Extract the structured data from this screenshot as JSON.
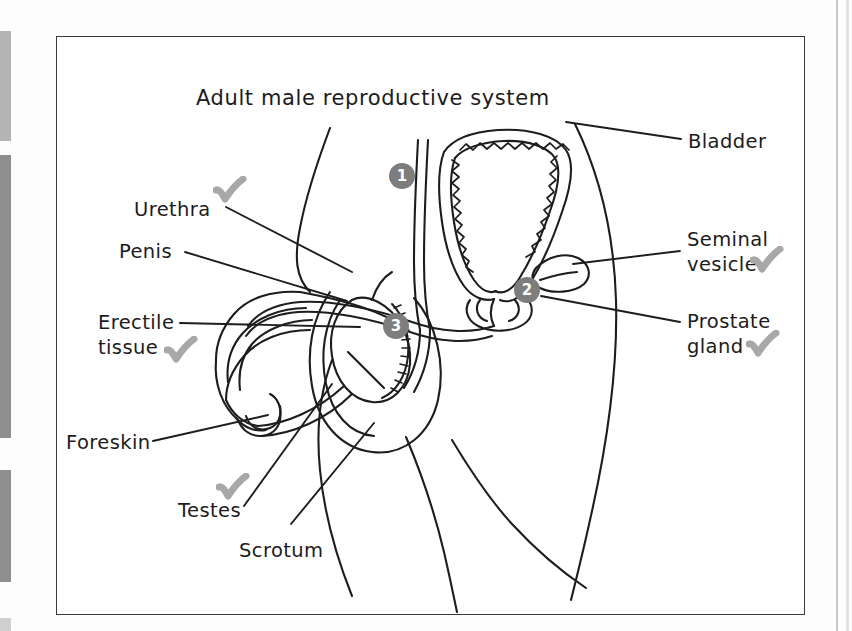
{
  "document": {
    "title": "Adult male reproductive system",
    "title_position": {
      "x": 196,
      "y": 86
    }
  },
  "colors": {
    "ink": "#1d1d1d",
    "border": "#3a3a3a",
    "badge_fill": "#7d7d7d",
    "badge_text": "#ffffff",
    "check_mark": "#a8a8a8",
    "page_background": "#ffffff",
    "edge_bar": "#8e8e8e"
  },
  "figure": {
    "box": {
      "x": 56,
      "y": 36,
      "width": 749,
      "height": 579
    },
    "caption": "Hand-drawn line diagram of the adult male reproductive system in side view, with leader lines to named structures.",
    "numbered_markers": [
      {
        "number": "1",
        "x": 389,
        "y": 163,
        "refers_to": "unlabelled structure 1 (sperm duct / vas deferens region)"
      },
      {
        "number": "2",
        "x": 514,
        "y": 277,
        "refers_to": "unlabelled structure 2 (prostate / urethra junction region)"
      },
      {
        "number": "3",
        "x": 383,
        "y": 313,
        "refers_to": "unlabelled structure 3 (epididymis region)"
      }
    ]
  },
  "labels": {
    "left": [
      {
        "id": "urethra",
        "text": "Urethra",
        "x": 134,
        "y": 197,
        "checked": true,
        "check": {
          "x": 213,
          "y": 176
        },
        "leader": {
          "x1": 226,
          "y1": 207,
          "x2": 352,
          "y2": 272
        }
      },
      {
        "id": "penis",
        "text": "Penis",
        "x": 119,
        "y": 239,
        "checked": false,
        "leader": {
          "x1": 185,
          "y1": 252,
          "x2": 345,
          "y2": 301
        }
      },
      {
        "id": "erectile-tissue",
        "text": "Erectile\ntissue",
        "x": 98,
        "y": 310,
        "checked": true,
        "check": {
          "x": 164,
          "y": 336
        },
        "leader": {
          "x1": 180,
          "y1": 323,
          "x2": 358,
          "y2": 327
        }
      },
      {
        "id": "foreskin",
        "text": "Foreskin",
        "x": 66,
        "y": 430,
        "checked": false,
        "leader": {
          "x1": 153,
          "y1": 441,
          "x2": 268,
          "y2": 416
        }
      },
      {
        "id": "testes",
        "text": "Testes",
        "x": 178,
        "y": 498,
        "checked": true,
        "check": {
          "x": 216,
          "y": 473
        },
        "leader": {
          "x1": 244,
          "y1": 507,
          "x2": 331,
          "y2": 386
        }
      },
      {
        "id": "scrotum",
        "text": "Scrotum",
        "x": 239,
        "y": 538,
        "checked": false,
        "leader": {
          "x1": 290,
          "y1": 524,
          "x2": 373,
          "y2": 424
        }
      }
    ],
    "right": [
      {
        "id": "bladder",
        "text": "Bladder",
        "x": 688,
        "y": 129,
        "checked": false,
        "leader": {
          "x1": 680,
          "y1": 140,
          "x2": 566,
          "y2": 122
        }
      },
      {
        "id": "seminal-vesicle",
        "text": "Seminal\nvesicle",
        "x": 687,
        "y": 227,
        "checked": true,
        "check": {
          "x": 750,
          "y": 246
        },
        "leader": {
          "x1": 679,
          "y1": 252,
          "x2": 572,
          "y2": 264
        }
      },
      {
        "id": "prostate-gland",
        "text": "Prostate\ngland",
        "x": 687,
        "y": 309,
        "checked": true,
        "check": {
          "x": 746,
          "y": 330
        },
        "leader": {
          "x1": 679,
          "y1": 322,
          "x2": 540,
          "y2": 296
        }
      }
    ]
  },
  "scan_artifacts": {
    "left_bars": [
      {
        "x": 0,
        "y": 31,
        "width": 11,
        "height": 110,
        "shade": "light"
      },
      {
        "x": 0,
        "y": 155,
        "width": 11,
        "height": 283,
        "shade": "dark"
      },
      {
        "x": 0,
        "y": 470,
        "width": 11,
        "height": 112,
        "shade": "dark"
      },
      {
        "x": 0,
        "y": 618,
        "width": 11,
        "height": 13,
        "shade": "faint"
      }
    ]
  }
}
